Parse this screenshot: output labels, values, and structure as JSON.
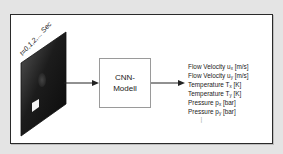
{
  "input": {
    "time_label": "t=0,1,2,... Sec",
    "image": "cfd-frame-sequence"
  },
  "model": {
    "label_line1": "CNN-",
    "label_line2": "Modell"
  },
  "outputs": [
    {
      "name": "Flow Velocity u",
      "sub": "x",
      "unit": "[m/s]"
    },
    {
      "name": "Flow Velocity u",
      "sub": "y",
      "unit": "[m/s]"
    },
    {
      "name": "Temperature T",
      "sub": "x",
      "unit": "[K]"
    },
    {
      "name": "Temperature T",
      "sub": "y",
      "unit": "[K]"
    },
    {
      "name": "Pressure p",
      "sub": "x",
      "unit": "[bar]"
    },
    {
      "name": "Pressure p",
      "sub": "y",
      "unit": "[bar]"
    }
  ],
  "ellipsis": "..."
}
